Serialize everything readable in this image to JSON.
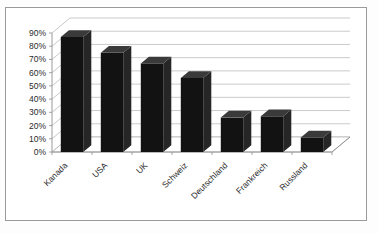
{
  "chart_data": {
    "type": "bar",
    "title": "",
    "subtitle": "",
    "xlabel": "",
    "ylabel": "",
    "categories": [
      "Kanada",
      "USA",
      "UK",
      "Schweiz",
      "Deutschland",
      "Frankreich",
      "Russland"
    ],
    "values": [
      87,
      75,
      67,
      56,
      26,
      27,
      11
    ],
    "value_format": "percent",
    "ylim": [
      0,
      90
    ],
    "ytick_values": [
      0,
      10,
      20,
      30,
      40,
      50,
      60,
      70,
      80,
      90
    ],
    "ytick_labels": [
      "0%",
      "10%",
      "20%",
      "30%",
      "40%",
      "50%",
      "60%",
      "70%",
      "80%",
      "90%"
    ],
    "grid": true,
    "grid_axis": "y",
    "legend": false,
    "legend_position": "none",
    "style": "3d-column",
    "series": [
      {
        "name": "",
        "values": [
          87,
          75,
          67,
          56,
          26,
          27,
          11
        ],
        "color": "#121212"
      }
    ],
    "colors": {
      "bar": "#121212",
      "bar_side": "#262626",
      "bar_top": "#3a3a3a",
      "gridline": "#b4b4b4",
      "axis": "#8f8f8f",
      "background": "#ffffff",
      "border": "#9a9a9a",
      "text": "#2b2b2b"
    }
  }
}
